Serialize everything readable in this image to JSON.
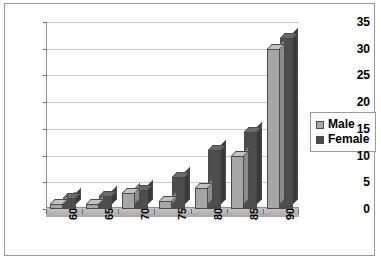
{
  "chart_data": {
    "type": "bar",
    "title": "",
    "subtitle": "",
    "xlabel": "",
    "ylabel": "",
    "categories": [
      "60-64",
      "65-69",
      "70-74",
      "75-79",
      "80-84",
      "85-89",
      "90 +"
    ],
    "series": [
      {
        "name": "Male",
        "color": "#a6a6a6",
        "values": [
          1,
          1,
          3,
          1.5,
          4,
          10,
          30
        ]
      },
      {
        "name": "Female",
        "color": "#4d4d4d",
        "values": [
          2,
          2.5,
          3.5,
          6,
          11,
          14.5,
          32
        ]
      }
    ],
    "ylim": [
      0,
      35
    ],
    "ytick_step": 5,
    "yticks": [
      "0",
      "5",
      "10",
      "15",
      "20",
      "25",
      "30",
      "35"
    ],
    "grid": true,
    "legend_position": "right",
    "style": "3d-clustered-column"
  },
  "legend": {
    "items": [
      {
        "label": "Male"
      },
      {
        "label": "Female"
      }
    ]
  },
  "colors": {
    "male": "#a6a6a6",
    "female": "#4d4d4d",
    "gridline": "#c8c8c8",
    "axis": "#8f8f8f",
    "frame": "#9a9a9a",
    "background": "#ffffff"
  }
}
